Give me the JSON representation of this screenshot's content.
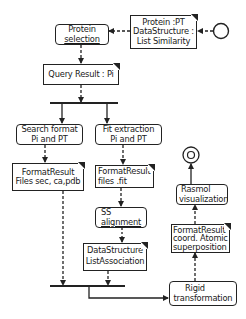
{
  "diagram": {
    "type": "UML activity diagram",
    "initial_node": {
      "label": ""
    },
    "final_node": {
      "label": ""
    },
    "nodes": {
      "protein_pt_note": {
        "kind": "object",
        "lines": [
          "Protein :PT",
          "DataStructure :",
          "List  Similarity"
        ]
      },
      "protein_selection": {
        "kind": "action",
        "lines": [
          "Protein",
          "selection"
        ]
      },
      "query_result": {
        "kind": "object",
        "lines": [
          "Query Result : Pi"
        ]
      },
      "search_format": {
        "kind": "action",
        "lines": [
          "Search format",
          "Pi and PT"
        ]
      },
      "fit_extraction": {
        "kind": "action",
        "lines": [
          "Fit extraction",
          "Pi and PT"
        ]
      },
      "format_result_files": {
        "kind": "object",
        "lines": [
          "FormatResult",
          "Files sec, ca,pdb"
        ]
      },
      "format_result_fit": {
        "kind": "object",
        "lines": [
          "FormatResult",
          "files .fit"
        ]
      },
      "ss_alignment": {
        "kind": "action",
        "lines": [
          "SS",
          "alignment"
        ]
      },
      "list_association": {
        "kind": "object",
        "lines": [
          "DataStructure",
          "ListAssociation"
        ]
      },
      "rigid_transformation": {
        "kind": "action",
        "lines": [
          "Rigid",
          "transformation"
        ]
      },
      "format_result_coord": {
        "kind": "object",
        "lines": [
          "FormatResult",
          "coord. Atomic",
          "superposition"
        ]
      },
      "rasmol_visualization": {
        "kind": "action",
        "lines": [
          "Rasmol",
          "visualization"
        ]
      }
    },
    "edges": [
      {
        "from": "initial_node",
        "to": "protein_pt_note",
        "style": "dashed"
      },
      {
        "from": "protein_pt_note",
        "to": "protein_selection",
        "style": "dashed"
      },
      {
        "from": "protein_selection",
        "to": "query_result",
        "style": "dashed"
      },
      {
        "from": "query_result",
        "to": "fork_bar",
        "style": "dashed"
      },
      {
        "from": "fork_bar",
        "to": "search_format",
        "style": "solid"
      },
      {
        "from": "fork_bar",
        "to": "fit_extraction",
        "style": "solid"
      },
      {
        "from": "search_format",
        "to": "format_result_files",
        "style": "dashed"
      },
      {
        "from": "fit_extraction",
        "to": "format_result_fit",
        "style": "dashed"
      },
      {
        "from": "format_result_fit",
        "to": "ss_alignment",
        "style": "dashed"
      },
      {
        "from": "ss_alignment",
        "to": "list_association",
        "style": "dashed"
      },
      {
        "from": "format_result_files",
        "to": "join_bar",
        "style": "dashed"
      },
      {
        "from": "list_association",
        "to": "join_bar",
        "style": "dashed"
      },
      {
        "from": "join_bar",
        "to": "rigid_transformation",
        "style": "solid"
      },
      {
        "from": "rigid_transformation",
        "to": "format_result_coord",
        "style": "dashed"
      },
      {
        "from": "format_result_coord",
        "to": "rasmol_visualization",
        "style": "dashed"
      },
      {
        "from": "rasmol_visualization",
        "to": "final_node",
        "style": "solid"
      }
    ]
  }
}
